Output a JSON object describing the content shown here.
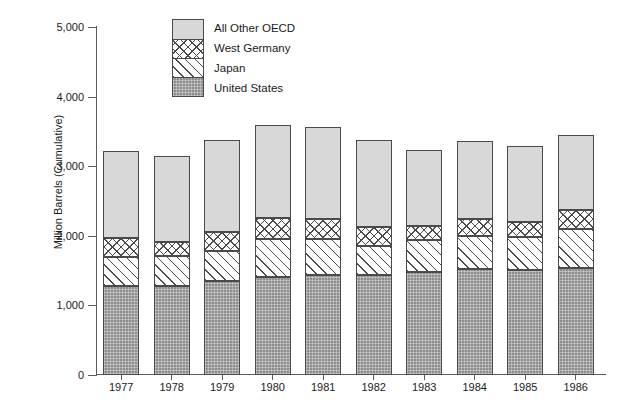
{
  "chart_data": {
    "type": "bar",
    "stacked": true,
    "title": "",
    "subtitle": "",
    "xlabel": "",
    "ylabel": "Million Barrels (Cumulative)",
    "ylim": [
      0,
      5000
    ],
    "yticks": [
      0,
      1000,
      2000,
      3000,
      4000,
      5000
    ],
    "ytick_labels": [
      "0",
      "1,000",
      "2,000",
      "3,000",
      "4,000",
      "5,000"
    ],
    "grid": false,
    "legend_position": "top-center",
    "categories": [
      "1977",
      "1978",
      "1979",
      "1980",
      "1981",
      "1982",
      "1983",
      "1984",
      "1985",
      "1986"
    ],
    "series": [
      {
        "name": "United States",
        "fill": "solid-gray",
        "color": "#8e8e8e",
        "values": [
          1285,
          1275,
          1345,
          1405,
          1435,
          1430,
          1480,
          1520,
          1510,
          1540
        ]
      },
      {
        "name": "Japan",
        "fill": "diagonal-hatch",
        "color": "#ffffff",
        "values": [
          410,
          430,
          430,
          545,
          515,
          420,
          455,
          475,
          475,
          565
        ]
      },
      {
        "name": "West Germany",
        "fill": "cross-hatch",
        "color": "#ffffff",
        "values": [
          280,
          210,
          275,
          300,
          290,
          275,
          200,
          245,
          210,
          265
        ]
      },
      {
        "name": "All Other OECD",
        "fill": "light-gray",
        "color": "#d8d8d8",
        "values": [
          1240,
          1235,
          1325,
          1345,
          1320,
          1245,
          1100,
          1125,
          1095,
          1075
        ]
      }
    ],
    "totals": [
      3215,
      3150,
      3375,
      3595,
      3560,
      3370,
      3235,
      3365,
      3290,
      3445
    ],
    "annotations": []
  },
  "legend": {
    "entries": [
      {
        "label": "All Other OECD",
        "fill": "light-gray"
      },
      {
        "label": "West Germany",
        "fill": "cross-hatch"
      },
      {
        "label": "Japan",
        "fill": "diagonal-hatch"
      },
      {
        "label": "United States",
        "fill": "solid-gray"
      }
    ]
  },
  "colors": {
    "axis": "#5c5c5c",
    "outline": "#4a4a4a",
    "text": "#1a1a1a",
    "background": "#ffffff",
    "oecd": "#d8d8d8",
    "united_states": "#8e8e8e"
  }
}
